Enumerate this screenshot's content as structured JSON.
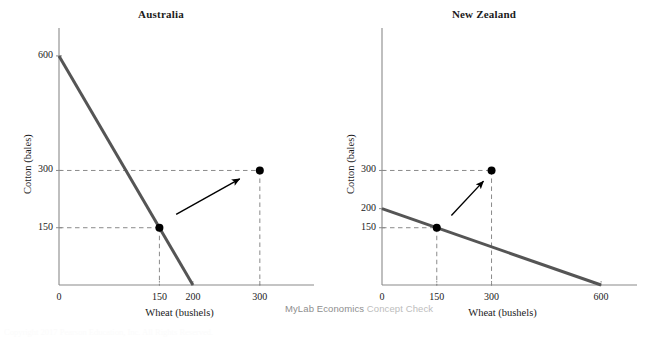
{
  "figure": {
    "background": "#ffffff",
    "ppf_line_color": "#555555",
    "axis_color": "#8a8a8a",
    "dashed_color": "#8a8a8a",
    "point_color": "#000000",
    "arrow_color": "#000000",
    "text_color": "#1b1b1b"
  },
  "watermark": {
    "strong": "MyLab Economics",
    "light": " Concept Check",
    "strong_color": "#8e8e8e",
    "light_color": "#bdbdbd"
  },
  "footer": {
    "ghost_text": "Copyright 2017 Pearson Education, Inc. All Rights Reserved."
  },
  "chart_data": [
    {
      "type": "line",
      "title": "Australia",
      "xlabel": "Wheat (bushels)",
      "ylabel": "Cotton (bales)",
      "xlim": [
        0,
        360
      ],
      "ylim": [
        0,
        660
      ],
      "xticks": [
        0,
        150,
        200,
        300
      ],
      "xticklabels": [
        "0",
        "150",
        "200",
        "300"
      ],
      "yticks": [
        150,
        300,
        600
      ],
      "yticklabels": [
        "150",
        "300",
        "600"
      ],
      "grid": false,
      "legend": "none",
      "series": [
        {
          "name": "Production possibilities frontier",
          "kind": "line",
          "x": [
            0,
            200
          ],
          "y": [
            600,
            0
          ]
        },
        {
          "name": "Production point on PPF",
          "kind": "point",
          "x": [
            150
          ],
          "y": [
            150
          ],
          "guides": "dashed"
        },
        {
          "name": "Consumption point after trade",
          "kind": "point",
          "x": [
            300
          ],
          "y": [
            300
          ],
          "guides": "dashed"
        },
        {
          "name": "Gains from trade arrow",
          "kind": "arrow",
          "from": [
            175,
            185
          ],
          "to": [
            270,
            278
          ]
        }
      ]
    },
    {
      "type": "line",
      "title": "New Zealand",
      "xlabel": "Wheat (bushels)",
      "ylabel": "Cotton (bales)",
      "xlim": [
        0,
        660
      ],
      "ylim": [
        0,
        660
      ],
      "xticks": [
        0,
        150,
        300,
        600
      ],
      "xticklabels": [
        "0",
        "150",
        "300",
        "600"
      ],
      "yticks": [
        150,
        200,
        300
      ],
      "yticklabels": [
        "150",
        "200",
        "300"
      ],
      "grid": false,
      "legend": "none",
      "series": [
        {
          "name": "Production possibilities frontier",
          "kind": "line",
          "x": [
            0,
            600
          ],
          "y": [
            200,
            0
          ]
        },
        {
          "name": "Production point on PPF",
          "kind": "point",
          "x": [
            150
          ],
          "y": [
            150
          ],
          "guides": "dashed"
        },
        {
          "name": "Consumption point after trade",
          "kind": "point",
          "x": [
            300
          ],
          "y": [
            300
          ],
          "guides": "dashed"
        },
        {
          "name": "Gains from trade arrow",
          "kind": "arrow",
          "from": [
            190,
            182
          ],
          "to": [
            278,
            272
          ]
        }
      ]
    }
  ]
}
